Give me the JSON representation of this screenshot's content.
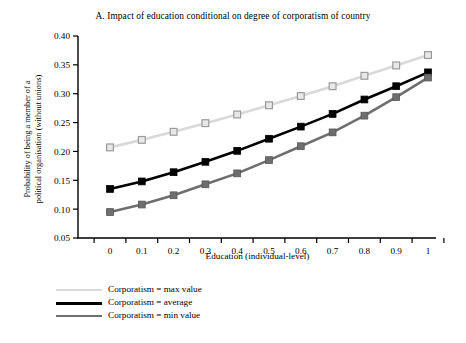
{
  "chart_data": {
    "type": "line",
    "title": "A. Impact of education conditional on degree of corporatism of country",
    "xlabel": "Education (individual-level)",
    "ylabel": "Probability of being a member of a\npolitical organisation (without unions)",
    "x": [
      0,
      0.1,
      0.2,
      0.3,
      0.4,
      0.5,
      0.6,
      0.7,
      0.8,
      0.9,
      1
    ],
    "xtick_labels": [
      "0",
      "0.1",
      "0.2",
      "0.3",
      "0.4",
      "0.5",
      "0.6",
      "0.7",
      "0.8",
      "0.9",
      "1"
    ],
    "ytick_labels": [
      "0.05",
      "0.10",
      "0.15",
      "0.20",
      "0.25",
      "0.30",
      "0.35",
      "0.40"
    ],
    "ytick_values": [
      0.05,
      0.1,
      0.15,
      0.2,
      0.25,
      0.3,
      0.35,
      0.4
    ],
    "xlim": [
      -0.05,
      1.05
    ],
    "ylim": [
      0.05,
      0.4
    ],
    "grid": false,
    "legend_position": "below-left",
    "series": [
      {
        "name": "Corporatism = max value",
        "color": "#d9d9d9",
        "marker": "square-open",
        "marker_fill": "#e8e8e8",
        "marker_stroke": "#9a9a9a",
        "values": [
          0.207,
          0.22,
          0.234,
          0.249,
          0.264,
          0.28,
          0.296,
          0.313,
          0.331,
          0.349,
          0.367
        ]
      },
      {
        "name": "Corporatism = average",
        "color": "#000000",
        "marker": "square-filled",
        "marker_fill": "#000000",
        "marker_stroke": "#000000",
        "values": [
          0.135,
          0.148,
          0.164,
          0.182,
          0.201,
          0.222,
          0.243,
          0.265,
          0.29,
          0.313,
          0.337
        ]
      },
      {
        "name": "Corporatism = min value",
        "color": "#6e6e6e",
        "marker": "square-filled",
        "marker_fill": "#6e6e6e",
        "marker_stroke": "#555555",
        "values": [
          0.095,
          0.108,
          0.124,
          0.143,
          0.162,
          0.185,
          0.209,
          0.233,
          0.262,
          0.294,
          0.328
        ]
      }
    ]
  },
  "legend": {
    "items": [
      {
        "label": "Corporatism = max value"
      },
      {
        "label": "Corporatism = average"
      },
      {
        "label": "Corporatism = min value"
      }
    ]
  }
}
